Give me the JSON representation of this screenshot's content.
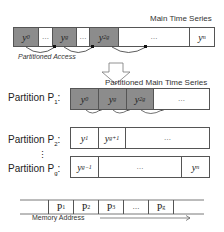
{
  "top": {
    "title": "Main Time Series",
    "cells": [
      {
        "label": "y",
        "sub": "0",
        "dark": true
      },
      {
        "label": "…",
        "sub": "",
        "dark": false
      },
      {
        "label": "y",
        "sub": "g",
        "dark": true
      },
      {
        "label": "…",
        "sub": "",
        "dark": false
      },
      {
        "label": "y",
        "sub": "2g",
        "dark": true
      },
      {
        "label": "…",
        "sub": "",
        "dark": false
      },
      {
        "label": "y",
        "sub": "n",
        "dark": false
      }
    ],
    "access_label": "Partitioned Access"
  },
  "partitioned": {
    "title": "Partitioned Main Time Series",
    "rows": [
      {
        "name": "Partition P",
        "sub": "1",
        "cells": [
          {
            "label": "y",
            "sub": "0",
            "dark": true
          },
          {
            "label": "y",
            "sub": "g",
            "dark": true
          },
          {
            "label": "y",
            "sub": "2g",
            "dark": true
          },
          {
            "label": "…",
            "sub": "",
            "dark": false
          }
        ]
      },
      {
        "name": "Partition P",
        "sub": "2",
        "cells": [
          {
            "label": "y",
            "sub": "1",
            "dark": false
          },
          {
            "label": "y",
            "sub": "g+1",
            "dark": false
          },
          {
            "label": "…",
            "sub": "",
            "dark": false
          }
        ]
      },
      {
        "name": "Partition P",
        "sub": "g",
        "cells": [
          {
            "label": "y",
            "sub": "g−1",
            "dark": false
          },
          {
            "label": "…",
            "sub": "",
            "dark": false
          },
          {
            "label": "y",
            "sub": "n",
            "dark": false
          }
        ]
      }
    ],
    "vdots": "⋮"
  },
  "memory": {
    "cells": [
      "",
      "P1",
      "P2",
      "P3",
      "…",
      "Pg",
      ""
    ],
    "cell_subs": [
      "",
      "1",
      "2",
      "3",
      "",
      "g",
      ""
    ],
    "axis_label": "Memory Address"
  },
  "colors": {
    "dark_cell": "#8c8c8c",
    "border": "#555555"
  }
}
